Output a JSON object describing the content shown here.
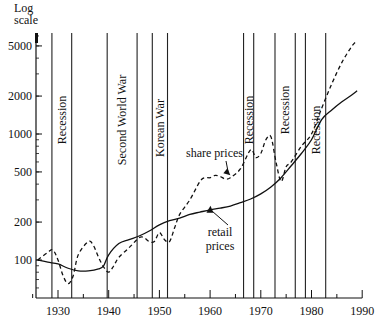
{
  "chart_data": {
    "type": "line",
    "title": "",
    "ylabel": "Log scale",
    "xlabel": "",
    "yscale": "log",
    "ylim": [
      50,
      6000
    ],
    "xlim": [
      1925,
      1990
    ],
    "xticks": [
      1930,
      1940,
      1950,
      1960,
      1970,
      1980,
      1990
    ],
    "yticks": [
      100,
      200,
      500,
      1000,
      2000,
      5000
    ],
    "grid": false,
    "legend": "inline annotations",
    "series": [
      {
        "name": "retail prices",
        "style": "solid",
        "x": [
          1926,
          1928,
          1930,
          1932,
          1934,
          1936,
          1938,
          1939,
          1940,
          1942,
          1944,
          1946,
          1948,
          1950,
          1952,
          1954,
          1956,
          1958,
          1960,
          1962,
          1964,
          1966,
          1968,
          1970,
          1972,
          1974,
          1976,
          1978,
          1980,
          1982,
          1984,
          1986,
          1988,
          1989
        ],
        "values": [
          100,
          96,
          93,
          86,
          82,
          82,
          85,
          90,
          110,
          135,
          145,
          155,
          170,
          190,
          205,
          215,
          230,
          240,
          250,
          258,
          268,
          285,
          305,
          335,
          380,
          450,
          560,
          700,
          900,
          1300,
          1550,
          1800,
          2050,
          2200
        ]
      },
      {
        "name": "share prices",
        "style": "dashed",
        "x": [
          1926,
          1928,
          1929,
          1930,
          1931,
          1932,
          1933,
          1934,
          1936,
          1937,
          1938,
          1939,
          1940,
          1941,
          1942,
          1944,
          1946,
          1947,
          1948,
          1949,
          1950,
          1951,
          1952,
          1953,
          1954,
          1956,
          1958,
          1959,
          1960,
          1961,
          1962,
          1963,
          1964,
          1966,
          1968,
          1969,
          1970,
          1971,
          1972,
          1973,
          1974,
          1975,
          1976,
          1978,
          1980,
          1982,
          1984,
          1986,
          1988,
          1989
        ],
        "values": [
          100,
          115,
          120,
          100,
          75,
          65,
          75,
          110,
          140,
          130,
          105,
          88,
          80,
          90,
          105,
          125,
          150,
          150,
          140,
          140,
          165,
          145,
          140,
          180,
          230,
          300,
          420,
          450,
          450,
          470,
          460,
          440,
          450,
          530,
          750,
          650,
          700,
          900,
          950,
          600,
          420,
          550,
          600,
          800,
          1000,
          1600,
          2500,
          3700,
          5000,
          5500
        ]
      }
    ],
    "annotations": [
      {
        "text": "Recession",
        "x_start": 1928.8,
        "x_end": 1932.7
      },
      {
        "text": "Second World War",
        "x_start": 1939.7,
        "x_end": 1945.6
      },
      {
        "text": "Korean War",
        "x_start": 1948.6,
        "x_end": 1951.6
      },
      {
        "text": "Recession",
        "x_start": 1966.6,
        "x_end": 1968.6
      },
      {
        "text": "Recession",
        "x_start": 1972.8,
        "x_end": 1976.8
      },
      {
        "text": "Recession",
        "x_start": 1978.8,
        "x_end": 1982.8
      },
      {
        "text": "share prices",
        "points_to": [
          1964,
          470
        ]
      },
      {
        "text": "retail prices",
        "points_to": [
          1965,
          280
        ]
      }
    ]
  },
  "axis": {
    "y_title_line1": "Log",
    "y_title_line2": "scale"
  }
}
